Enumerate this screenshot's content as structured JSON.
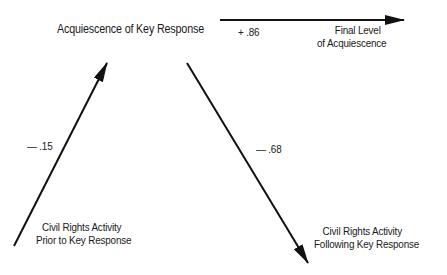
{
  "diagram": {
    "nodes": {
      "key_response": "Acquiescence of Key Response",
      "final_level_line1": "Final Level",
      "final_level_line2": "of Acquiescence",
      "prior_line1": "Civil Rights Activity",
      "prior_line2": "Prior to Key Response",
      "following_line1": "Civil Rights Activity",
      "following_line2": "Following Key Response"
    },
    "edges": [
      {
        "from": "Civil Rights Activity Prior to Key Response",
        "to": "Acquiescence of Key Response",
        "label": "— .15"
      },
      {
        "from": "Acquiescence of Key Response",
        "to": "Final Level of Acquiescence",
        "label": "+ .86"
      },
      {
        "from": "Acquiescence of Key Response",
        "to": "Civil Rights Activity Following Key Response",
        "label": "— .68"
      }
    ],
    "colors": {
      "line": "#111111",
      "text": "#1a1a1a",
      "background": "#ffffff"
    }
  }
}
